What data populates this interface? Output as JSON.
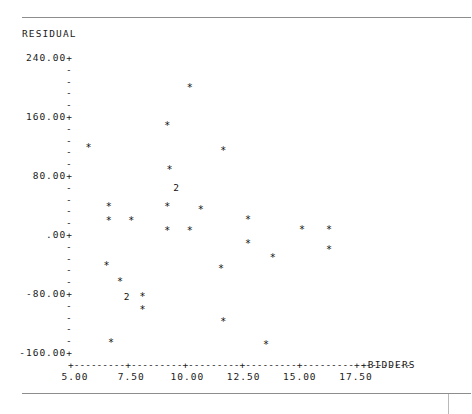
{
  "plot": {
    "y_axis_title": "RESIDUAL",
    "x_axis_title": "+BIDDERS",
    "y_tick_labels": [
      "240.00+",
      "160.00+",
      "80.00+",
      ".00+",
      "-80.00+",
      "-160.00+"
    ],
    "y_minor_tick": "-",
    "x_tick_labels": [
      "5.00",
      "7.50",
      "10.00",
      "12.50",
      "15.00",
      "17.50"
    ],
    "x_axis_line": "+---------+---------+---------+---------+---------+---------",
    "point_glyph": "*",
    "multi_glyph": "2"
  },
  "chart_data": {
    "type": "scatter",
    "title": "",
    "xlabel": "BIDDERS",
    "ylabel": "RESIDUAL",
    "xlim": [
      4.2,
      18.2
    ],
    "ylim": [
      -176.0,
      250.0
    ],
    "grid": false,
    "legend": "none",
    "x_ticks": [
      5.0,
      7.5,
      10.0,
      12.5,
      15.0,
      17.5
    ],
    "y_ticks": [
      240.0,
      160.0,
      80.0,
      0.0,
      -80.0,
      -160.0
    ],
    "y_minor_ticks_between": 4,
    "counts_note": "glyph '2' marks two coincident observations",
    "points": [
      {
        "x": 10.1,
        "y": 198.0,
        "n": 1,
        "label": "*"
      },
      {
        "x": 9.1,
        "y": 147.0,
        "n": 1,
        "label": "*"
      },
      {
        "x": 5.6,
        "y": 116.0,
        "n": 1,
        "label": "*"
      },
      {
        "x": 11.6,
        "y": 113.0,
        "n": 1,
        "label": "*"
      },
      {
        "x": 9.2,
        "y": 87.0,
        "n": 1,
        "label": "*"
      },
      {
        "x": 9.5,
        "y": 63.0,
        "n": 2,
        "label": "2"
      },
      {
        "x": 6.5,
        "y": 36.0,
        "n": 1,
        "label": "*"
      },
      {
        "x": 9.1,
        "y": 36.0,
        "n": 1,
        "label": "*"
      },
      {
        "x": 10.6,
        "y": 32.0,
        "n": 1,
        "label": "*"
      },
      {
        "x": 6.5,
        "y": 17.0,
        "n": 1,
        "label": "*"
      },
      {
        "x": 7.5,
        "y": 17.0,
        "n": 1,
        "label": "*"
      },
      {
        "x": 12.7,
        "y": 19.0,
        "n": 1,
        "label": "*"
      },
      {
        "x": 9.1,
        "y": 4.0,
        "n": 1,
        "label": "*"
      },
      {
        "x": 10.1,
        "y": 4.0,
        "n": 1,
        "label": "*"
      },
      {
        "x": 15.1,
        "y": 6.0,
        "n": 1,
        "label": "*"
      },
      {
        "x": 16.3,
        "y": 6.0,
        "n": 1,
        "label": "*"
      },
      {
        "x": 12.7,
        "y": -13.0,
        "n": 1,
        "label": "*"
      },
      {
        "x": 16.3,
        "y": -22.0,
        "n": 1,
        "label": "*"
      },
      {
        "x": 13.8,
        "y": -33.0,
        "n": 1,
        "label": "*"
      },
      {
        "x": 6.4,
        "y": -44.0,
        "n": 1,
        "label": "*"
      },
      {
        "x": 11.5,
        "y": -47.0,
        "n": 1,
        "label": "*"
      },
      {
        "x": 7.0,
        "y": -65.0,
        "n": 1,
        "label": "*"
      },
      {
        "x": 7.3,
        "y": -86.0,
        "n": 2,
        "label": "2"
      },
      {
        "x": 8.0,
        "y": -86.0,
        "n": 1,
        "label": "*"
      },
      {
        "x": 8.0,
        "y": -103.0,
        "n": 1,
        "label": "*"
      },
      {
        "x": 11.6,
        "y": -119.0,
        "n": 1,
        "label": "*"
      },
      {
        "x": 6.6,
        "y": -148.0,
        "n": 1,
        "label": "*"
      },
      {
        "x": 13.5,
        "y": -150.0,
        "n": 1,
        "label": "*"
      }
    ]
  }
}
